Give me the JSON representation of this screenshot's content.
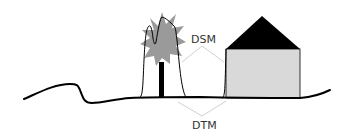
{
  "diagram": {
    "labels": {
      "dsm": "DSM",
      "dtm": "DTM"
    },
    "colors": {
      "ground_line": "#000000",
      "tree_canopy": "#9a9a9a",
      "tree_trunk": "#000000",
      "surface_outline": "#000000",
      "house_wall": "#d9d9d9",
      "house_roof": "#000000",
      "leader_lines": "#d0d0d0",
      "label_text": "#333333"
    },
    "elements": [
      "terrain",
      "tree",
      "house",
      "dsm-surface-outline",
      "dsm-label",
      "dtm-label"
    ]
  }
}
